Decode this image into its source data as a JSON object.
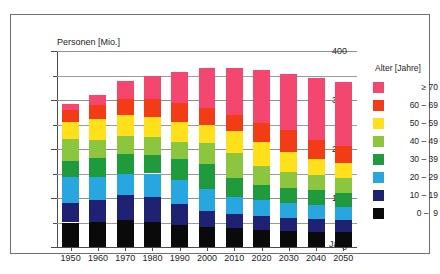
{
  "top_strip_text": "",
  "axes": {
    "ylabel": "Personen [Mio.]",
    "xlabel": "Jahr",
    "y_ticks": [
      "0",
      "100",
      "200",
      "300",
      "400"
    ]
  },
  "legend": {
    "title": "Alter [Jahre]",
    "entries": [
      {
        "label": "≥ 70",
        "color": "#f4partial"
      }
    ]
  },
  "chart_data": {
    "type": "bar",
    "stacked": true,
    "title": "",
    "subtitle": "",
    "xlabel": "Jahr",
    "ylabel": "Personen [Mio.]",
    "ylim": [
      0,
      400
    ],
    "ytick_values": [
      0,
      100,
      200,
      300,
      400
    ],
    "yminor_tick_values": [
      50,
      150,
      250,
      350
    ],
    "grid": "horizontal-major",
    "legend_position": "right",
    "legend_title": "Alter [Jahre]",
    "categories": [
      "1950",
      "1960",
      "1970",
      "1980",
      "1990",
      "2000",
      "2010",
      "2020",
      "2030",
      "2040",
      "2050"
    ],
    "series": [
      {
        "name": "0 -  9",
        "color": "#0a0a0a",
        "values": [
          50,
          51,
          56,
          52,
          45,
          41,
          38,
          35,
          32,
          31,
          30
        ]
      },
      {
        "name": "10 - 19",
        "color": "#1f2172",
        "values": [
          39,
          45,
          51,
          51,
          42,
          33,
          30,
          29,
          28,
          26,
          25
        ]
      },
      {
        "name": "20 - 29",
        "color": "#27a6e0",
        "values": [
          54,
          46,
          41,
          47,
          50,
          44,
          34,
          31,
          30,
          29,
          27
        ]
      },
      {
        "name": "30 - 39",
        "color": "#1f9a3c",
        "values": [
          32,
          39,
          41,
          38,
          43,
          51,
          39,
          32,
          31,
          30,
          28
        ]
      },
      {
        "name": "40 - 49",
        "color": "#8cc63e",
        "values": [
          45,
          38,
          37,
          36,
          35,
          43,
          51,
          38,
          32,
          31,
          30
        ]
      },
      {
        "name": "50 - 59",
        "color": "#ffe01b",
        "values": [
          35,
          42,
          43,
          41,
          41,
          37,
          44,
          50,
          40,
          33,
          31
        ]
      },
      {
        "name": "60 - 69",
        "color": "#f23c15",
        "values": [
          25,
          28,
          34,
          37,
          37,
          35,
          33,
          39,
          45,
          39,
          36
        ]
      },
      {
        "name": "≥ 70",
        "color": "#f4476f",
        "values": [
          12,
          22,
          36,
          48,
          65,
          81,
          97,
          108,
          116,
          126,
          130
        ]
      }
    ],
    "legend_entries": [
      {
        "label": "≥ 70",
        "color": "#f4476f"
      },
      {
        "label": "60 – 69",
        "color": "#f23c15"
      },
      {
        "label": "50 – 59",
        "color": "#ffe01b"
      },
      {
        "label": "40 – 49",
        "color": "#8cc63e"
      },
      {
        "label": "30 – 39",
        "color": "#1f9a3c"
      },
      {
        "label": "20 – 29",
        "color": "#27a6e0"
      },
      {
        "label": "10 – 19",
        "color": "#1f2172"
      },
      {
        "label": "0 –  9",
        "color": "#0a0a0a"
      }
    ],
    "totals": [
      292,
      311,
      339,
      350,
      358,
      365,
      366,
      362,
      354,
      345,
      337
    ]
  }
}
